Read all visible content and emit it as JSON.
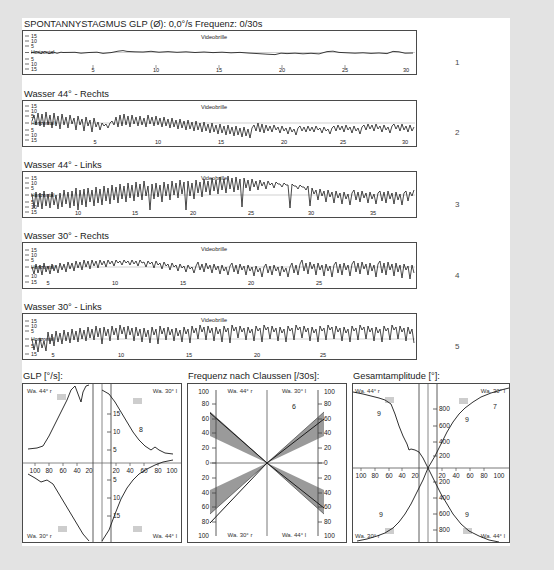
{
  "report": {
    "header": {
      "title": "SPONTANNYSTAGMUS",
      "glp_label": "GLP (Ø): 0,0°/s",
      "freq_label": "Frequenz: 0/30s"
    },
    "videobrille_label": "Videobrille",
    "horizontal_label": "Horizontal",
    "panel_numbers": [
      "1",
      "2",
      "3",
      "4",
      "5"
    ],
    "traces": [
      {
        "num": "1",
        "title": "SPONTANNYSTAGMUS   GLP (Ø): 0,0°/s   Frequenz: 0/30s",
        "short_title": "Spontannystagmus",
        "y_ticks_up": [
          "15",
          "10",
          "5"
        ],
        "y_ticks_down": [
          "5",
          "10",
          "15"
        ],
        "x_ticks": [
          "5",
          "10",
          "15",
          "20",
          "25",
          "30"
        ],
        "x_max": 30
      },
      {
        "num": "2",
        "title": "Wasser 44° - Rechts",
        "y_ticks_up": [
          "15",
          "10",
          "5"
        ],
        "y_ticks_down": [
          "5",
          "10",
          "15"
        ],
        "x_ticks": [
          "5",
          "10",
          "15",
          "20",
          "25",
          "30"
        ],
        "x_max": 31
      },
      {
        "num": "3",
        "title": "Wasser 44° - Links",
        "y_ticks_up": [
          "15",
          "10",
          "5"
        ],
        "y_ticks_down": [
          "5",
          "10",
          "15"
        ],
        "x_ticks": [
          "10",
          "15",
          "20",
          "25",
          "30",
          "35"
        ],
        "x_max": 37
      },
      {
        "num": "4",
        "title": "Wasser 30° - Rechts",
        "y_ticks_up": [
          "15",
          "10",
          "5"
        ],
        "y_ticks_down": [
          "10",
          "15"
        ],
        "x_ticks": [
          "5",
          "10",
          "15",
          "20",
          "25"
        ],
        "x_max": 29
      },
      {
        "num": "5",
        "title": "Wasser 30° - Links",
        "y_ticks_up": [
          "15",
          "10",
          "5"
        ],
        "y_ticks_down": [
          "5",
          "15"
        ],
        "x_ticks": [
          "5",
          "10",
          "15",
          "20",
          "25"
        ],
        "x_max": 29
      }
    ],
    "butterflies": [
      {
        "id": "glp",
        "title": "GLP [°/s]:",
        "quadrant_labels": {
          "top_left": "Wa. 44° r",
          "top_right": "Wa. 30° l",
          "bottom_left": "Wa. 30° r",
          "bottom_right": "Wa. 44° l"
        },
        "y_ticks": [
          "15",
          "10",
          "5"
        ],
        "x_ticks_left": [
          "100",
          "80",
          "60",
          "40",
          "20"
        ],
        "x_ticks_right": [
          "20",
          "40",
          "60",
          "80",
          "100"
        ],
        "values": {
          "top_right": "8"
        },
        "shaded": false
      },
      {
        "id": "claussen",
        "title": "Frequenz nach Claussen [/30s]:",
        "quadrant_labels": {
          "top_left": "Wa. 44° r",
          "top_right": "Wa. 30° l",
          "bottom_left": "Wa. 30° r",
          "bottom_right": "Wa. 44° l"
        },
        "y_ticks_top": [
          "100",
          "80",
          "60",
          "40",
          "20"
        ],
        "y_zero": "0",
        "y_ticks_bottom": [
          "20",
          "40",
          "60",
          "80",
          "100"
        ],
        "values": {
          "top_right": "6"
        },
        "shaded": true
      },
      {
        "id": "gesamtamplitude",
        "title": "Gesamtamplitude [°]:",
        "quadrant_labels": {
          "top_left": "Wa. 44° r",
          "top_right": "Wa. 30° l",
          "bottom_left": "Wa. 30° r",
          "bottom_right": "Wa. 44° l"
        },
        "y_ticks_top": [
          "800",
          "600",
          "400",
          "200"
        ],
        "y_ticks_bottom": [
          "200",
          "400",
          "600",
          "800"
        ],
        "x_ticks_left": [
          "100",
          "80",
          "60",
          "40",
          "20"
        ],
        "x_ticks_right": [
          "20",
          "40",
          "60",
          "80",
          "100"
        ],
        "values": {
          "top_left": "9",
          "top_right_inner": "9",
          "top_right_outer": "7",
          "bottom_left": "9",
          "bottom_right": "9"
        },
        "shaded": false
      }
    ],
    "colors": {
      "page_background": "#e3e3e3",
      "panel_background": "#ffffff",
      "border": "#4a4a4a",
      "trace_line": "#1a1a1a",
      "shaded_region": "#9a9a9a",
      "marker": "#c9c9c9",
      "text": "#1b1b1b"
    }
  }
}
